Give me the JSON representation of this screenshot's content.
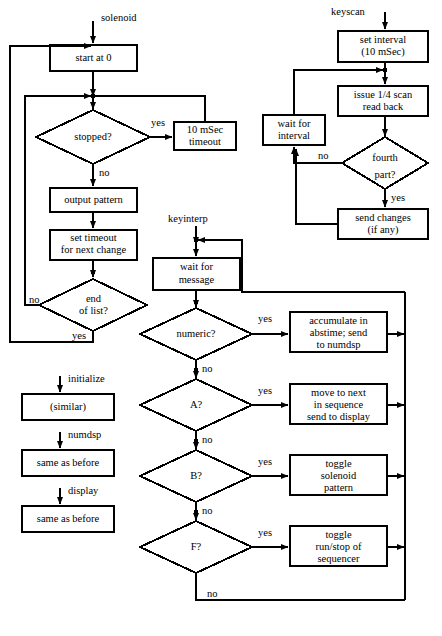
{
  "figure": {
    "type": "flowchart",
    "title": "",
    "caption": "",
    "background": "#ffffff",
    "stroke": "#000000",
    "line_width": 2
  },
  "flows": [
    {
      "id": "solenoid",
      "entry_label": "solenoid",
      "nodes": [
        {
          "id": "start-at-0",
          "shape": "box",
          "text": "start at 0"
        },
        {
          "id": "stopped",
          "shape": "diamond",
          "text": "stopped?"
        },
        {
          "id": "10-msec-timeout",
          "shape": "box",
          "text": "10 mSec\ntimeout"
        },
        {
          "id": "output-pattern",
          "shape": "box",
          "text": "output pattern"
        },
        {
          "id": "set-timeout",
          "shape": "box",
          "text": "set timeout\nfor next change"
        },
        {
          "id": "end-of-list",
          "shape": "diamond",
          "text": "end\nof list?"
        }
      ],
      "edge_labels": [
        "yes",
        "no",
        "no",
        "yes"
      ]
    },
    {
      "id": "keyscan",
      "entry_label": "keyscan",
      "nodes": [
        {
          "id": "set-interval",
          "shape": "box",
          "text": "set interval\n(10 mSec)"
        },
        {
          "id": "issue-quarter-scan",
          "shape": "box",
          "text": "issue 1/4 scan\nread back"
        },
        {
          "id": "fourth-part",
          "shape": "diamond",
          "text": "fourth\npart?"
        },
        {
          "id": "wait-for-interval",
          "shape": "box",
          "text": "wait for\ninterval"
        },
        {
          "id": "send-changes",
          "shape": "box",
          "text": "send changes\n(if any)"
        }
      ],
      "edge_labels": [
        "no",
        "yes"
      ]
    },
    {
      "id": "keyinterp",
      "entry_label": "keyinterp",
      "nodes": [
        {
          "id": "wait-for-message",
          "shape": "box",
          "text": "wait for\nmessage"
        },
        {
          "id": "numeric",
          "shape": "diamond",
          "text": "numeric?"
        },
        {
          "id": "accumulate",
          "shape": "box",
          "text": "accumulate in\nabstime; send\nto numdsp"
        },
        {
          "id": "a-key",
          "shape": "diamond",
          "text": "A?"
        },
        {
          "id": "move-to-next",
          "shape": "box",
          "text": "move to next\nin sequence\nsend to display"
        },
        {
          "id": "b-key",
          "shape": "diamond",
          "text": "B?"
        },
        {
          "id": "toggle-solenoid",
          "shape": "box",
          "text": "toggle\nsolenoid\npattern"
        },
        {
          "id": "f-key",
          "shape": "diamond",
          "text": "F?"
        },
        {
          "id": "toggle-runstop",
          "shape": "box",
          "text": "toggle\nrun/stop of\nsequencer"
        }
      ],
      "edge_labels": [
        "yes",
        "no",
        "yes",
        "no",
        "yes",
        "no",
        "yes",
        "no"
      ]
    },
    {
      "id": "stubs",
      "entry_label": "",
      "nodes": [
        {
          "id": "initialize-stub",
          "shape": "box",
          "text": "(similar)"
        },
        {
          "id": "numdsp-stub",
          "shape": "box",
          "text": "same as before"
        },
        {
          "id": "display-stub",
          "shape": "box",
          "text": "same as before"
        }
      ],
      "edge_labels": [
        "initialize",
        "numdsp",
        "display"
      ]
    }
  ],
  "labels": {
    "solenoid": "solenoid",
    "keyscan": "keyscan",
    "keyinterp": "keyinterp",
    "initialize": "initialize",
    "numdsp": "numdsp",
    "display": "display",
    "start_at_0": "start at 0",
    "stopped": "stopped?",
    "timeout_l1": "10 mSec",
    "timeout_l2": "timeout",
    "output_pattern": "output pattern",
    "set_timeout_l1": "set timeout",
    "set_timeout_l2": "for next change",
    "end_of_list_l1": "end",
    "end_of_list_l2": "of list?",
    "similar": "(similar)",
    "same_as_before_1": "same as before",
    "same_as_before_2": "same as before",
    "set_interval_l1": "set interval",
    "set_interval_l2": "(10 mSec)",
    "issue_scan_l1": "issue 1/4 scan",
    "issue_scan_l2": "read back",
    "fourth_part_l1": "fourth",
    "fourth_part_l2": "part?",
    "wait_interval_l1": "wait for",
    "wait_interval_l2": "interval",
    "send_changes_l1": "send changes",
    "send_changes_l2": "(if any)",
    "wait_message_l1": "wait for",
    "wait_message_l2": "message",
    "numeric": "numeric?",
    "accumulate_l1": "accumulate in",
    "accumulate_l2": "abstime; send",
    "accumulate_l3": "to numdsp",
    "a_key": "A?",
    "move_next_l1": "move to next",
    "move_next_l2": "in sequence",
    "move_next_l3": "send to display",
    "b_key": "B?",
    "toggle_sol_l1": "toggle",
    "toggle_sol_l2": "solenoid",
    "toggle_sol_l3": "pattern",
    "f_key": "F?",
    "toggle_run_l1": "toggle",
    "toggle_run_l2": "run/stop of",
    "toggle_run_l3": "sequencer",
    "yes_stopped": "yes",
    "no_stopped": "no",
    "no_endlist": "no",
    "yes_endlist": "yes",
    "no_fourth": "no",
    "yes_fourth": "yes",
    "yes_numeric": "yes",
    "no_numeric": "no",
    "yes_a": "yes",
    "no_a": "no",
    "yes_b": "yes",
    "no_b": "no",
    "yes_f": "yes",
    "no_f": "no"
  }
}
